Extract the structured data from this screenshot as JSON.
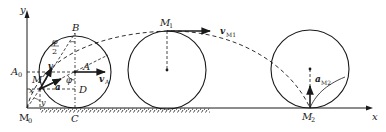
{
  "diagram": {
    "type": "rolling-wheel-cycloid",
    "colors": {
      "line": "#1a1a1a",
      "background": "#ffffff"
    },
    "axes": {
      "x_label": "x",
      "y_label": "y",
      "origin_label": "M",
      "origin_sub": "0"
    },
    "wheel1": {
      "points": {
        "B": "B",
        "A": "A",
        "C": "C",
        "D": "D",
        "M": "M"
      },
      "A0_label": "A",
      "A0_sub": "0",
      "vA_label": "v",
      "vA_sub": "A",
      "v_label": "v",
      "a_label": "a",
      "phi_label": "φ",
      "half_phi_num": "φ",
      "half_phi_den": "2",
      "x_label": "x",
      "y_label": "y"
    },
    "wheel2": {
      "point_label": "M",
      "point_sub": "1",
      "v_label": "v",
      "v_sub": "M1"
    },
    "wheel3": {
      "point_label": "M",
      "point_sub": "2",
      "a_label": "a",
      "a_sub": "M2"
    }
  }
}
